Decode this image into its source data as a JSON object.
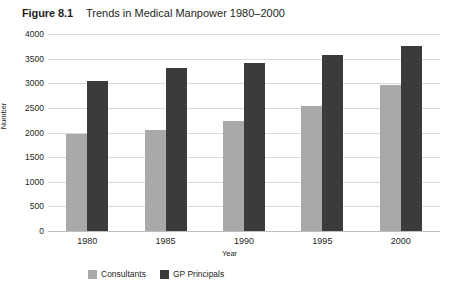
{
  "figure": {
    "number": "Figure 8.1",
    "caption": "Trends in Medical Manpower 1980–2000"
  },
  "colors": {
    "consultants": "#a9a9a9",
    "gp_principals": "#3b3b3b",
    "gridline": "#d9d9d9",
    "text": "#231f20",
    "background": "#ffffff"
  },
  "chart_data": {
    "type": "bar",
    "title": "Trends in Medical Manpower 1980–2000",
    "xlabel": "Year",
    "ylabel": "Number",
    "categories": [
      "1980",
      "1985",
      "1990",
      "1995",
      "2000"
    ],
    "series": [
      {
        "name": "Consultants",
        "color": "#a9a9a9",
        "values": [
          1970,
          2050,
          2240,
          2530,
          2970
        ]
      },
      {
        "name": "GP Principals",
        "color": "#3b3b3b",
        "values": [
          3050,
          3300,
          3420,
          3580,
          3750
        ]
      }
    ],
    "ylim": [
      0,
      4000
    ],
    "yticks": [
      0,
      500,
      1000,
      1500,
      2000,
      2500,
      3000,
      3500,
      4000
    ],
    "ytick_labels": [
      "0",
      "500",
      "1000",
      "1500",
      "2000",
      "2500",
      "3000",
      "3500",
      "4000"
    ],
    "grid": true,
    "legend_position": "bottom-left"
  }
}
